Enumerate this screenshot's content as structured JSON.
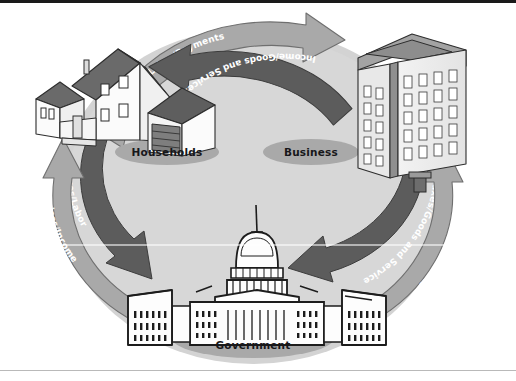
{
  "figure": {
    "type": "circular-flow-diagram",
    "background_color": "#ffffff",
    "circle_fill": "#d2d2d2",
    "border_top_color": "#1a1a1a",
    "border_bottom_color": "#b9b9b9"
  },
  "nodes": [
    {
      "id": "households",
      "label": "Households",
      "icon": "house-illustration",
      "shadow_color": "#a8a8a8"
    },
    {
      "id": "business",
      "label": "Business",
      "icon": "office-building-illustration",
      "shadow_color": "#a8a8a8"
    },
    {
      "id": "government",
      "label": "Government",
      "icon": "capitol-building-illustration",
      "shadow_color": "#a8a8a8"
    }
  ],
  "flows": [
    {
      "id": "labor-payments",
      "label": "Labor/Payments",
      "from": "households",
      "to": "business",
      "arc": "top-outer",
      "color": "#a9a9a9",
      "text_color": "#ffffff",
      "direction": "right"
    },
    {
      "id": "income-goods-services",
      "label": "Income/Goods and Services",
      "from": "business",
      "to": "households",
      "arc": "top-inner",
      "color": "#5c5c5c",
      "text_color": "#ffffff",
      "direction": "left"
    },
    {
      "id": "taxes-labor",
      "label": "Taxes/Labor",
      "from": "households",
      "to": "government",
      "arc": "left-inner",
      "color": "#5c5c5c",
      "text_color": "#ffffff",
      "direction": "down"
    },
    {
      "id": "services-income",
      "label": "Services/Income",
      "from": "government",
      "to": "households",
      "arc": "left-outer",
      "color": "#a9a9a9",
      "text_color": "#ffffff",
      "direction": "up"
    },
    {
      "id": "taxes-goods-service",
      "label": "Taxes/Goods and Service",
      "from": "business",
      "to": "government",
      "arc": "right-inner",
      "color": "#5c5c5c",
      "text_color": "#ffffff",
      "direction": "down"
    },
    {
      "id": "services-payments",
      "label": "Services/Payments",
      "from": "government",
      "to": "business",
      "arc": "right-outer",
      "color": "#a9a9a9",
      "text_color": "#ffffff",
      "direction": "up"
    }
  ]
}
